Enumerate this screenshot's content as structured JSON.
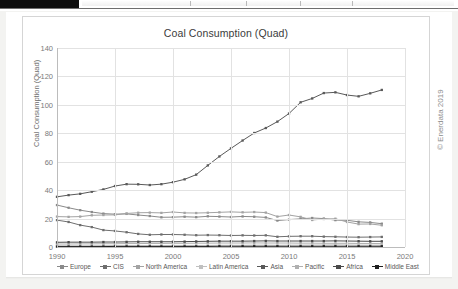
{
  "window": {
    "top_strip_present": true
  },
  "watermark": {
    "text": "© Enerdata 2019"
  },
  "chart_data": {
    "type": "line",
    "title": "Coal Consumption (Quad)",
    "xlabel": "",
    "ylabel": "Coal Consumption (Quad)",
    "xlim": [
      1990,
      2020
    ],
    "ylim": [
      0,
      140
    ],
    "ytick_step": 20,
    "xtick_step": 5,
    "yticks": [
      0,
      20,
      40,
      60,
      80,
      100,
      120,
      140
    ],
    "xticks": [
      1990,
      1995,
      2000,
      2005,
      2010,
      2015,
      2020
    ],
    "grid": true,
    "legend_position": "bottom",
    "markers": "square",
    "x": [
      1990,
      1991,
      1992,
      1993,
      1994,
      1995,
      1996,
      1997,
      1998,
      1999,
      2000,
      2001,
      2002,
      2003,
      2004,
      2005,
      2006,
      2007,
      2008,
      2009,
      2010,
      2011,
      2012,
      2013,
      2014,
      2015,
      2016,
      2017,
      2018
    ],
    "series": [
      {
        "name": "Europe",
        "color": "#8a8a8a",
        "values": [
          29.5,
          27.6,
          25.9,
          24.6,
          23.5,
          23.1,
          23.3,
          22.5,
          21.8,
          20.9,
          21.0,
          21.3,
          21.0,
          21.6,
          21.4,
          21.1,
          21.5,
          21.3,
          20.8,
          18.6,
          19.3,
          19.8,
          20.4,
          20.0,
          18.9,
          18.8,
          17.7,
          17.3,
          16.4
        ]
      },
      {
        "name": "CIS",
        "color": "#6e6e6e",
        "values": [
          18.9,
          17.6,
          15.4,
          14.0,
          11.9,
          11.3,
          10.4,
          9.2,
          8.6,
          8.8,
          8.8,
          8.6,
          8.3,
          8.4,
          8.3,
          8.1,
          8.2,
          8.1,
          8.2,
          7.2,
          7.5,
          7.6,
          7.6,
          7.3,
          7.2,
          7.0,
          6.9,
          7.0,
          7.1
        ]
      },
      {
        "name": "North America",
        "color": "#a3a3a3",
        "values": [
          21.4,
          21.2,
          21.4,
          22.3,
          22.5,
          22.6,
          23.6,
          24.1,
          24.2,
          24.0,
          24.6,
          24.0,
          23.9,
          24.1,
          24.4,
          24.7,
          24.4,
          24.6,
          24.2,
          21.4,
          22.5,
          21.2,
          19.0,
          19.7,
          19.9,
          17.6,
          16.1,
          16.2,
          15.3
        ]
      },
      {
        "name": "Latin America",
        "color": "#c0c0c0",
        "values": [
          0.9,
          0.9,
          0.9,
          0.9,
          1.0,
          1.0,
          1.0,
          1.0,
          1.0,
          1.0,
          1.1,
          1.1,
          1.1,
          1.1,
          1.2,
          1.2,
          1.2,
          1.3,
          1.3,
          1.2,
          1.3,
          1.3,
          1.4,
          1.4,
          1.5,
          1.4,
          1.3,
          1.3,
          1.3
        ]
      },
      {
        "name": "Asia",
        "color": "#595959",
        "values": [
          35.3,
          36.5,
          37.4,
          38.9,
          40.5,
          42.9,
          44.2,
          44.1,
          43.6,
          44.2,
          45.6,
          47.6,
          50.9,
          57.4,
          63.7,
          69.4,
          74.9,
          80.2,
          83.7,
          88.2,
          93.9,
          101.8,
          104.5,
          108.3,
          108.8,
          106.9,
          106.0,
          108.1,
          110.5
        ]
      },
      {
        "name": "Pacific",
        "color": "#b0b0b0",
        "values": [
          2.1,
          2.1,
          2.2,
          2.2,
          2.3,
          2.3,
          2.4,
          2.4,
          2.5,
          2.5,
          2.6,
          2.6,
          2.7,
          2.7,
          2.8,
          2.8,
          2.8,
          2.9,
          2.8,
          2.8,
          2.8,
          2.7,
          2.7,
          2.6,
          2.6,
          2.6,
          2.5,
          2.5,
          2.4
        ]
      },
      {
        "name": "Africa",
        "color": "#4a4a4a",
        "values": [
          3.3,
          3.4,
          3.4,
          3.4,
          3.5,
          3.5,
          3.6,
          3.7,
          3.7,
          3.7,
          3.7,
          3.8,
          3.9,
          4.0,
          4.1,
          4.1,
          4.1,
          4.2,
          4.3,
          4.2,
          4.2,
          4.2,
          4.2,
          4.2,
          4.3,
          4.2,
          4.1,
          4.0,
          4.0
        ]
      },
      {
        "name": "Middle East",
        "color": "#1f1f1f",
        "values": [
          0.3,
          0.3,
          0.3,
          0.3,
          0.3,
          0.4,
          0.4,
          0.4,
          0.4,
          0.4,
          0.4,
          0.4,
          0.4,
          0.4,
          0.5,
          0.5,
          0.5,
          0.5,
          0.5,
          0.5,
          0.5,
          0.5,
          0.5,
          0.5,
          0.5,
          0.5,
          0.5,
          0.5,
          0.5
        ]
      }
    ]
  }
}
